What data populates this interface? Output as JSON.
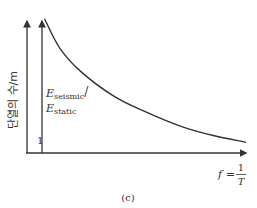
{
  "chart_data": {
    "type": "line",
    "title": "",
    "ylabel": "단열의 수/m",
    "xlabel": {
      "lhs": "f",
      "eq": "=",
      "numerator": "1",
      "denominator": "T"
    },
    "ratio_label": {
      "top_main": "E",
      "top_sub": "seismic",
      "slash": "/",
      "bottom_main": "E",
      "bottom_sub": "static"
    },
    "reference_value_label": "1",
    "caption": "(c)",
    "series": [
      {
        "name": "E_seismic/E_static",
        "shape": "decreasing-convex",
        "x": [
          0.08,
          0.15,
          0.25,
          0.4,
          0.55,
          0.7,
          0.85,
          1.0
        ],
        "y": [
          1.0,
          0.78,
          0.6,
          0.42,
          0.3,
          0.2,
          0.13,
          0.08
        ]
      }
    ],
    "xlim": [
      0,
      1
    ],
    "ylim": [
      0,
      1.08
    ],
    "grid": false
  }
}
